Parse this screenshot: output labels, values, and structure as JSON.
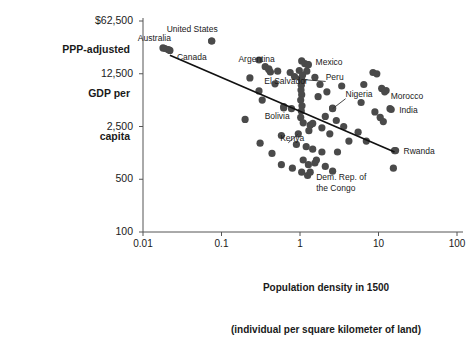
{
  "chart_data": {
    "type": "scatter",
    "title": "",
    "ylabel": "PPP-adjusted GDP per capita",
    "ylabel_lines": [
      "PPP-adjusted",
      "GDP per",
      "capita"
    ],
    "xlabel": "Population density in 1500 (individual per square kilometer of land)",
    "xlabel_lines": [
      "Population density in 1500",
      "(individual per square kilometer of land)"
    ],
    "xscale": "log",
    "yscale": "log",
    "xlim": [
      0.01,
      100
    ],
    "ylim": [
      100,
      62500
    ],
    "xticks": [
      "0.01",
      "0.1",
      "1",
      "10",
      "100"
    ],
    "xtick_values": [
      0.01,
      0.1,
      1,
      10,
      100
    ],
    "yticks": [
      "$62,500",
      "12,500",
      "2,500",
      "500",
      "100"
    ],
    "ytick_values": [
      62500,
      12500,
      2500,
      500,
      100
    ],
    "grid": false,
    "legend": "none",
    "marker_color": "#4a4a4a",
    "trendline_color": "#111111",
    "axis_color": "#555555",
    "trendline": {
      "x0": 0.022,
      "y0": 22000,
      "x1": 16.0,
      "y1": 1150
    },
    "labeled_points": [
      {
        "name": "Australia",
        "x": 0.019,
        "y": 27000,
        "label_dx": -26,
        "label_dy": -10,
        "leader": false
      },
      {
        "name": "Canada",
        "x": 0.022,
        "y": 25500,
        "label_dx": 7,
        "label_dy": 8,
        "leader": false
      },
      {
        "name": "United States",
        "x": 0.075,
        "y": 34000,
        "label_dx": -22,
        "label_dy": -11,
        "leader": false
      },
      {
        "name": "Argentina",
        "x": 0.4,
        "y": 14500,
        "label_dx": -32,
        "label_dy": -9,
        "leader": false
      },
      {
        "name": "Mexico",
        "x": 1.25,
        "y": 16500,
        "label_dx": 8,
        "label_dy": -2,
        "leader": false
      },
      {
        "name": "El Salvador",
        "x": 1.05,
        "y": 10000,
        "label_dx": -52,
        "label_dy": 1,
        "leader": false
      },
      {
        "name": "Peru",
        "x": 1.05,
        "y": 10500,
        "label_dx": 24,
        "label_dy": -2,
        "leader": true
      },
      {
        "name": "Nigeria",
        "x": 2.6,
        "y": 4300,
        "label_dx": 13,
        "label_dy": -14,
        "leader": true
      },
      {
        "name": "Morocco",
        "x": 12.0,
        "y": 7200,
        "label_dx": 6,
        "label_dy": 5,
        "leader": false
      },
      {
        "name": "India",
        "x": 14.5,
        "y": 4200,
        "label_dx": 8,
        "label_dy": 1,
        "leader": false
      },
      {
        "name": "Bolivia",
        "x": 0.62,
        "y": 4400,
        "label_dx": -16,
        "label_dy": 9,
        "leader": false
      },
      {
        "name": "Kenya",
        "x": 0.95,
        "y": 2000,
        "label_dx": -40,
        "label_dy": 5,
        "leader": true
      },
      {
        "name": "Rwanda",
        "x": 16.5,
        "y": 1200,
        "label_dx": 8,
        "label_dy": 1,
        "leader": false
      },
      {
        "name": "Dem. Rep. of the Congo",
        "x": 1.35,
        "y": 620,
        "label_dx": 6,
        "label_dy": 6,
        "leader": false
      }
    ],
    "points": [
      {
        "x": 0.018,
        "y": 27500
      },
      {
        "x": 0.021,
        "y": 26000
      },
      {
        "x": 0.075,
        "y": 34000
      },
      {
        "x": 0.3,
        "y": 19000
      },
      {
        "x": 0.36,
        "y": 15500
      },
      {
        "x": 0.4,
        "y": 14200
      },
      {
        "x": 0.42,
        "y": 13200
      },
      {
        "x": 0.52,
        "y": 13500
      },
      {
        "x": 0.48,
        "y": 9200
      },
      {
        "x": 0.75,
        "y": 13000
      },
      {
        "x": 0.85,
        "y": 11500
      },
      {
        "x": 0.23,
        "y": 11000
      },
      {
        "x": 0.3,
        "y": 7400
      },
      {
        "x": 0.33,
        "y": 5600
      },
      {
        "x": 0.62,
        "y": 4600
      },
      {
        "x": 0.78,
        "y": 4300
      },
      {
        "x": 0.2,
        "y": 3100
      },
      {
        "x": 0.58,
        "y": 1900
      },
      {
        "x": 0.31,
        "y": 1500
      },
      {
        "x": 0.44,
        "y": 1100
      },
      {
        "x": 1.05,
        "y": 18500
      },
      {
        "x": 1.15,
        "y": 17000
      },
      {
        "x": 1.28,
        "y": 16500
      },
      {
        "x": 0.98,
        "y": 13800
      },
      {
        "x": 1.22,
        "y": 13500
      },
      {
        "x": 1.08,
        "y": 12000
      },
      {
        "x": 1.02,
        "y": 10800
      },
      {
        "x": 1.06,
        "y": 10000
      },
      {
        "x": 1.04,
        "y": 8800
      },
      {
        "x": 1.03,
        "y": 7600
      },
      {
        "x": 1.05,
        "y": 6600
      },
      {
        "x": 1.02,
        "y": 5600
      },
      {
        "x": 1.06,
        "y": 4700
      },
      {
        "x": 1.04,
        "y": 4000
      },
      {
        "x": 1.02,
        "y": 3300
      },
      {
        "x": 1.1,
        "y": 2800
      },
      {
        "x": 1.35,
        "y": 2600
      },
      {
        "x": 1.45,
        "y": 2750
      },
      {
        "x": 1.3,
        "y": 2200
      },
      {
        "x": 1.55,
        "y": 11200
      },
      {
        "x": 1.8,
        "y": 9000
      },
      {
        "x": 1.7,
        "y": 6200
      },
      {
        "x": 2.2,
        "y": 7200
      },
      {
        "x": 2.6,
        "y": 4400
      },
      {
        "x": 2.1,
        "y": 3400
      },
      {
        "x": 2.9,
        "y": 3000
      },
      {
        "x": 1.9,
        "y": 2400
      },
      {
        "x": 2.4,
        "y": 2000
      },
      {
        "x": 3.4,
        "y": 8600
      },
      {
        "x": 3.6,
        "y": 2500
      },
      {
        "x": 4.2,
        "y": 1600
      },
      {
        "x": 0.9,
        "y": 1450
      },
      {
        "x": 1.2,
        "y": 1350
      },
      {
        "x": 1.45,
        "y": 1250
      },
      {
        "x": 1.1,
        "y": 900
      },
      {
        "x": 1.28,
        "y": 780
      },
      {
        "x": 1.55,
        "y": 820
      },
      {
        "x": 1.62,
        "y": 900
      },
      {
        "x": 0.8,
        "y": 700
      },
      {
        "x": 1.05,
        "y": 620
      },
      {
        "x": 1.25,
        "y": 560
      },
      {
        "x": 0.58,
        "y": 780
      },
      {
        "x": 2.1,
        "y": 740
      },
      {
        "x": 2.6,
        "y": 640
      },
      {
        "x": 1.9,
        "y": 1150
      },
      {
        "x": 6.5,
        "y": 9000
      },
      {
        "x": 8.5,
        "y": 13000
      },
      {
        "x": 9.5,
        "y": 12500
      },
      {
        "x": 11.0,
        "y": 8000
      },
      {
        "x": 12.5,
        "y": 7500
      },
      {
        "x": 14.0,
        "y": 4300
      },
      {
        "x": 9.0,
        "y": 3900
      },
      {
        "x": 10.5,
        "y": 3300
      },
      {
        "x": 11.5,
        "y": 2900
      },
      {
        "x": 16.0,
        "y": 1200
      },
      {
        "x": 15.5,
        "y": 700
      },
      {
        "x": 5.5,
        "y": 2100
      },
      {
        "x": 7.0,
        "y": 1600
      },
      {
        "x": 3.0,
        "y": 1150
      },
      {
        "x": 6.0,
        "y": 5200
      }
    ]
  }
}
